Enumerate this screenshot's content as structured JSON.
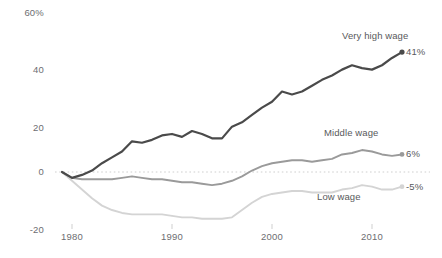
{
  "chart_data": {
    "type": "line",
    "title": "",
    "subtitle": "",
    "xlabel": "",
    "ylabel": "",
    "xlim": [
      1979,
      2013
    ],
    "ylim": [
      -20,
      60
    ],
    "grid": false,
    "zero_line": true,
    "legend_position": "inline-right",
    "y_ticks": [
      {
        "value": 60,
        "label": "60%"
      },
      {
        "value": 40,
        "label": "40"
      },
      {
        "value": 20,
        "label": "20"
      },
      {
        "value": 0,
        "label": "0"
      },
      {
        "value": -20,
        "label": "-20"
      }
    ],
    "x_ticks": [
      {
        "value": 1980,
        "label": "1980"
      },
      {
        "value": 1990,
        "label": "1990"
      },
      {
        "value": 2000,
        "label": "2000"
      },
      {
        "value": 2010,
        "label": "2010"
      }
    ],
    "x": [
      1979,
      1980,
      1981,
      1982,
      1983,
      1984,
      1985,
      1986,
      1987,
      1988,
      1989,
      1990,
      1991,
      1992,
      1993,
      1994,
      1995,
      1996,
      1997,
      1998,
      1999,
      2000,
      2001,
      2002,
      2003,
      2004,
      2005,
      2006,
      2007,
      2008,
      2009,
      2010,
      2011,
      2012,
      2013
    ],
    "series": [
      {
        "name": "Very high wage",
        "color": "#4a4a4a",
        "width": 2.2,
        "end_label": "41%",
        "end_value": 41,
        "label_x": 2007.0,
        "label_y": 46.5,
        "values": [
          0,
          -2,
          -1,
          0.5,
          3,
          5,
          7,
          10.5,
          10,
          11,
          12.5,
          13,
          12,
          14,
          13,
          11.5,
          11.5,
          15.5,
          17,
          19.5,
          22,
          24,
          27.5,
          26.5,
          27.5,
          29.5,
          31.5,
          33,
          35,
          36.5,
          35.5,
          35,
          36.5,
          39,
          41
        ]
      },
      {
        "name": "Middle wage",
        "color": "#9a9a9a",
        "width": 1.9,
        "end_label": "6%",
        "end_value": 6,
        "label_x": 2005.2,
        "label_y": 13.5,
        "values": [
          0,
          -2,
          -2.5,
          -2.5,
          -2.5,
          -2.5,
          -2,
          -1.5,
          -2,
          -2.5,
          -2.5,
          -3,
          -3.5,
          -3.5,
          -4,
          -4.5,
          -4,
          -3,
          -1.5,
          0.5,
          2,
          3,
          3.5,
          4,
          4,
          3.5,
          4,
          4.5,
          6,
          6.5,
          7.5,
          7,
          6,
          5.5,
          6
        ]
      },
      {
        "name": "Low wage",
        "color": "#d4d4d4",
        "width": 1.9,
        "end_label": "-5%",
        "end_value": -5,
        "label_x": 2004.5,
        "label_y": -8.5,
        "values": [
          0,
          -3,
          -6,
          -9,
          -11.5,
          -13,
          -14,
          -14.5,
          -14.5,
          -14.5,
          -14.5,
          -15,
          -15.5,
          -15.5,
          -16,
          -16,
          -16,
          -15.5,
          -13,
          -10.5,
          -8.5,
          -7.5,
          -7,
          -6.5,
          -6.5,
          -7,
          -7,
          -7,
          -6,
          -5.5,
          -4.5,
          -5,
          -6,
          -6,
          -5
        ]
      }
    ]
  }
}
